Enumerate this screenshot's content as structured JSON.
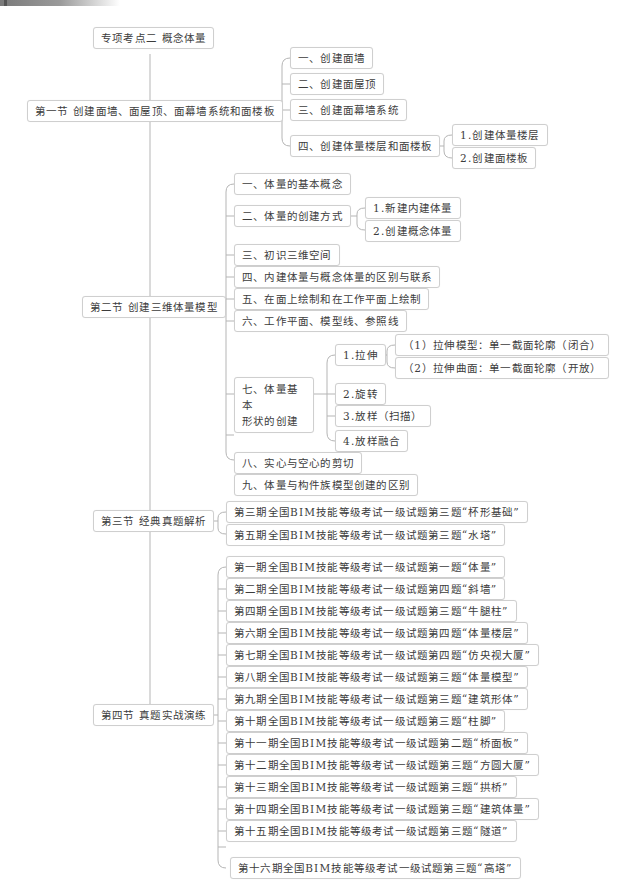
{
  "root": {
    "label": "专项考点二 概念体量"
  },
  "sections": [
    {
      "label": "第一节 创建面墙、面屋顶、面幕墙系统和面楼板",
      "children": [
        {
          "label": "一、创建面墙"
        },
        {
          "label": "二、创建面屋顶"
        },
        {
          "label": "三、创建面幕墙系统"
        },
        {
          "label": "四、创建体量楼层和面楼板",
          "children": [
            {
              "label": "1.创建体量楼层"
            },
            {
              "label": "2.创建面楼板"
            }
          ]
        }
      ]
    },
    {
      "label": "第二节 创建三维体量模型",
      "children": [
        {
          "label": "一、体量的基本概念"
        },
        {
          "label": "二、体量的创建方式",
          "children": [
            {
              "label": "1.新建内建体量"
            },
            {
              "label": "2.创建概念体量"
            }
          ]
        },
        {
          "label": "三、初识三维空间"
        },
        {
          "label": "四、内建体量与概念体量的区别与联系"
        },
        {
          "label": "五、在面上绘制和在工作平面上绘制"
        },
        {
          "label": "六、工作平面、模型线、参照线"
        },
        {
          "label_line1": "七、体量基本",
          "label_line2": "形状的创建",
          "children": [
            {
              "label": "1.拉伸",
              "children": [
                {
                  "label": "（1）拉伸模型：单一截面轮廓（闭合）"
                },
                {
                  "label": "（2）拉伸曲面：单一截面轮廓（开放）"
                }
              ]
            },
            {
              "label": "2.旋转"
            },
            {
              "label": "3.放样（扫描）"
            },
            {
              "label": "4.放样融合"
            }
          ]
        },
        {
          "label": "八、实心与空心的剪切"
        },
        {
          "label": "九、体量与构件族模型创建的区别"
        }
      ]
    },
    {
      "label": "第三节 经典真题解析",
      "children": [
        {
          "label": "第三期全国BIM技能等级考试一级试题第三题“杯形基础”"
        },
        {
          "label": "第五期全国BIM技能等级考试一级试题第三题“水塔”"
        }
      ]
    },
    {
      "label": "第四节 真题实战演练",
      "children": [
        {
          "label": "第一期全国BIM技能等级考试一级试题第一题“体量”"
        },
        {
          "label": "第二期全国BIM技能等级考试一级试题第四题“斜墙”"
        },
        {
          "label": "第四期全国BIM技能等级考试一级试题第三题“牛腿柱”"
        },
        {
          "label": "第六期全国BIM技能等级考试一级试题第四题“体量楼层”"
        },
        {
          "label": "第七期全国BIM技能等级考试一级试题第四题“仿央视大厦”"
        },
        {
          "label": "第八期全国BIM技能等级考试一级试题第三题“体量模型”"
        },
        {
          "label": "第九期全国BIM技能等级考试一级试题第三题“建筑形体”"
        },
        {
          "label": "第十期全国BIM技能等级考试一级试题第三题“柱脚”"
        },
        {
          "label": "第十一期全国BIM技能等级考试一级试题第二题“桥面板”"
        },
        {
          "label": "第十二期全国BIM技能等级考试一级试题第三题“方圆大厦”"
        },
        {
          "label": "第十三期全国BIM技能等级考试一级试题第三题“拱桥”"
        },
        {
          "label": "第十四期全国BIM技能等级考试一级试题第三题“建筑体量”"
        },
        {
          "label": "第十五期全国BIM技能等级考试一级试题第三题“隧道”"
        },
        {
          "label": "第十六期全国BIM技能等级考试一级试题第三题“高塔”"
        }
      ]
    }
  ],
  "colors": {
    "line": "#b5b5b5",
    "border": "#cfcfcf",
    "text": "#3c3c3c"
  }
}
